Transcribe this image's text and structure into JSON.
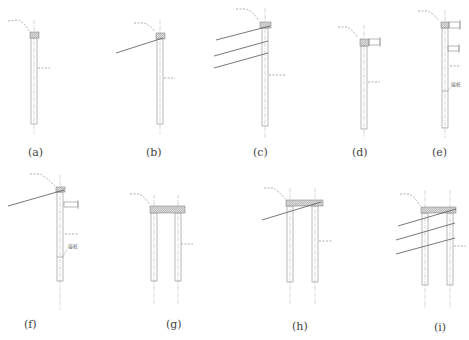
{
  "figure": {
    "panels": [
      {
        "id": "a",
        "label": "(a)",
        "type": "single-pile-cantilever"
      },
      {
        "id": "b",
        "label": "(b)",
        "type": "single-pile-one-anchor"
      },
      {
        "id": "c",
        "label": "(c)",
        "type": "single-pile-three-anchors"
      },
      {
        "id": "d",
        "label": "(d)",
        "type": "single-pile-one-strut"
      },
      {
        "id": "e",
        "label": "(e)",
        "type": "single-pile-two-struts-spliced",
        "annotation": "接桩"
      },
      {
        "id": "f",
        "label": "(f)",
        "type": "single-pile-anchor-and-strut-spliced",
        "annotation": "接桩"
      },
      {
        "id": "g",
        "label": "(g)",
        "type": "double-row-piles"
      },
      {
        "id": "h",
        "label": "(h)",
        "type": "double-row-piles-one-anchor"
      },
      {
        "id": "i",
        "label": "(i)",
        "type": "double-row-piles-three-anchors"
      }
    ]
  },
  "colors": {
    "line": "#888888",
    "anchor": "#555555",
    "cap_fill": "#cfcfcf",
    "dash": "#777777"
  }
}
